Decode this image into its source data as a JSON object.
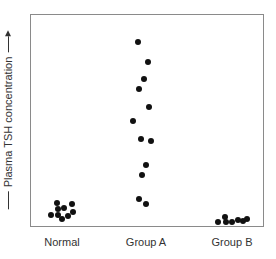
{
  "chart_data": {
    "type": "scatter",
    "subtype": "dot-strip",
    "title": "",
    "xlabel": "",
    "ylabel": "Plasma TSH concentration",
    "y_axis_arrow": true,
    "y_ticks": false,
    "grid": false,
    "legend": null,
    "categories": [
      "Normal",
      "Group A",
      "Group B"
    ],
    "series": [
      {
        "name": "Normal",
        "count": 9,
        "relative_values": [
          0.11,
          0.11,
          0.09,
          0.09,
          0.07,
          0.06,
          0.06,
          0.06,
          0.04
        ]
      },
      {
        "name": "Group A",
        "count": 12,
        "relative_values": [
          0.88,
          0.78,
          0.7,
          0.66,
          0.57,
          0.5,
          0.42,
          0.41,
          0.3,
          0.25,
          0.13,
          0.11
        ]
      },
      {
        "name": "Group B",
        "count": 7,
        "relative_values": [
          0.04,
          0.02,
          0.02,
          0.02,
          0.02,
          0.02,
          0.01
        ]
      }
    ],
    "note": "No numeric y-axis scale shown; values are relative heights (0 = bottom, 1 = top of plot box)."
  },
  "plot": {
    "box": {
      "left": 30,
      "top": 14,
      "width": 234,
      "height": 213
    },
    "dot_color": "#111111",
    "border_color": "#8a8a8a",
    "points": [
      {
        "group": "Normal",
        "x": 57,
        "y": 203
      },
      {
        "group": "Normal",
        "x": 72,
        "y": 204
      },
      {
        "group": "Normal",
        "x": 58,
        "y": 209
      },
      {
        "group": "Normal",
        "x": 64,
        "y": 208
      },
      {
        "group": "Normal",
        "x": 73,
        "y": 212
      },
      {
        "group": "Normal",
        "x": 51,
        "y": 215
      },
      {
        "group": "Normal",
        "x": 58,
        "y": 215
      },
      {
        "group": "Normal",
        "x": 62,
        "y": 219
      },
      {
        "group": "Normal",
        "x": 68,
        "y": 216
      },
      {
        "group": "Group A",
        "x": 138,
        "y": 42
      },
      {
        "group": "Group A",
        "x": 148,
        "y": 62
      },
      {
        "group": "Group A",
        "x": 144,
        "y": 79
      },
      {
        "group": "Group A",
        "x": 139,
        "y": 89
      },
      {
        "group": "Group A",
        "x": 149,
        "y": 107
      },
      {
        "group": "Group A",
        "x": 133,
        "y": 121
      },
      {
        "group": "Group A",
        "x": 141,
        "y": 139
      },
      {
        "group": "Group A",
        "x": 151,
        "y": 141
      },
      {
        "group": "Group A",
        "x": 146,
        "y": 165
      },
      {
        "group": "Group A",
        "x": 142,
        "y": 175
      },
      {
        "group": "Group A",
        "x": 139,
        "y": 199
      },
      {
        "group": "Group A",
        "x": 146,
        "y": 204
      },
      {
        "group": "Group B",
        "x": 218,
        "y": 222
      },
      {
        "group": "Group B",
        "x": 225,
        "y": 217
      },
      {
        "group": "Group B",
        "x": 226,
        "y": 222
      },
      {
        "group": "Group B",
        "x": 232,
        "y": 222
      },
      {
        "group": "Group B",
        "x": 238,
        "y": 220
      },
      {
        "group": "Group B",
        "x": 243,
        "y": 221
      },
      {
        "group": "Group B",
        "x": 247,
        "y": 219
      }
    ]
  },
  "labels": {
    "y_axis": "Plasma TSH concentration",
    "x_categories": [
      {
        "text": "Normal",
        "x": 62
      },
      {
        "text": "Group A",
        "x": 146
      },
      {
        "text": "Group B",
        "x": 232
      }
    ]
  }
}
